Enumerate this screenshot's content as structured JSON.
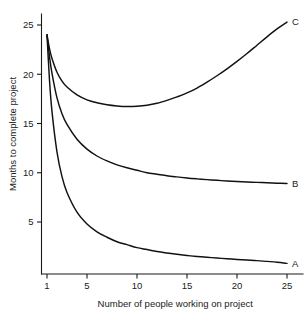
{
  "chart_data": {
    "type": "line",
    "title": "",
    "xlabel": "Number of people working on project",
    "ylabel": "Months to complete project",
    "xlim": [
      0.6,
      26.2
    ],
    "ylim": [
      0,
      26.5
    ],
    "xticks": [
      1,
      5,
      10,
      15,
      20,
      25
    ],
    "xticklabels": [
      "1",
      "5",
      "10",
      "15",
      "20",
      "25"
    ],
    "yticks": [
      5,
      10,
      15,
      20,
      25
    ],
    "yticklabels": [
      "5",
      "10",
      "15",
      "20",
      "25"
    ],
    "grid": false,
    "legend": "inline-end-labels",
    "line_color": "#111111",
    "axis_color": "#1a1a1a",
    "background": "#ffffff",
    "x": [
      1,
      1.25,
      1.5,
      2,
      2.5,
      3,
      4,
      5,
      6,
      7,
      8,
      9,
      10,
      11,
      12,
      13,
      14,
      15,
      16,
      17,
      18,
      19,
      20,
      21,
      22,
      23,
      24,
      25
    ],
    "series": [
      {
        "name": "A",
        "label": "A",
        "annotation": "A",
        "values": [
          24.0,
          19.4,
          16.2,
          12.1,
          9.6,
          8.0,
          6.0,
          4.8,
          4.0,
          3.45,
          3.0,
          2.7,
          2.4,
          2.2,
          2.0,
          1.85,
          1.72,
          1.6,
          1.5,
          1.42,
          1.34,
          1.27,
          1.2,
          1.14,
          1.08,
          1.0,
          0.92,
          0.8
        ]
      },
      {
        "name": "B",
        "label": "B",
        "annotation": "B",
        "values": [
          24.0,
          21.8,
          20.1,
          17.6,
          16.0,
          14.9,
          13.4,
          12.4,
          11.7,
          11.2,
          10.8,
          10.5,
          10.25,
          10.0,
          9.85,
          9.7,
          9.58,
          9.47,
          9.38,
          9.3,
          9.23,
          9.17,
          9.12,
          9.07,
          9.02,
          8.98,
          8.94,
          8.9
        ]
      },
      {
        "name": "C",
        "label": "C",
        "annotation": "C",
        "values": [
          24.0,
          22.6,
          21.6,
          20.2,
          19.3,
          18.7,
          17.9,
          17.4,
          17.1,
          16.9,
          16.78,
          16.72,
          16.75,
          16.85,
          17.05,
          17.35,
          17.7,
          18.1,
          18.6,
          19.2,
          19.85,
          20.55,
          21.3,
          22.1,
          22.95,
          23.8,
          24.6,
          25.3
        ]
      }
    ],
    "annotations": [
      {
        "text": "A",
        "x": 25,
        "y": 0.8
      },
      {
        "text": "B",
        "x": 25,
        "y": 8.9
      },
      {
        "text": "C",
        "x": 25,
        "y": 25.3
      }
    ]
  }
}
